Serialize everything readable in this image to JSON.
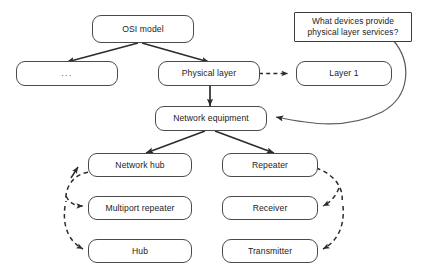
{
  "diagram": {
    "nodes": [
      {
        "id": "osi_model",
        "label": "OSI model"
      },
      {
        "id": "ellipsis",
        "label": "..."
      },
      {
        "id": "physical_layer",
        "label": "Physical layer"
      },
      {
        "id": "layer_1",
        "label": "Layer 1"
      },
      {
        "id": "question",
        "label": "What devices provide physical layer services?"
      },
      {
        "id": "network_equipment",
        "label": "Network equipment"
      },
      {
        "id": "network_hub",
        "label": "Network hub"
      },
      {
        "id": "repeater",
        "label": "Repeater"
      },
      {
        "id": "multiport_repeater",
        "label": "Multiport repeater"
      },
      {
        "id": "receiver",
        "label": "Receiver"
      },
      {
        "id": "hub",
        "label": "Hub"
      },
      {
        "id": "transmitter",
        "label": "Transmitter"
      }
    ],
    "question_lines": [
      "What devices provide",
      "physical layer services?"
    ],
    "edges": [
      {
        "from": "osi_model",
        "to": "ellipsis",
        "style": "solid",
        "label": ""
      },
      {
        "from": "osi_model",
        "to": "physical_layer",
        "style": "solid",
        "label": ""
      },
      {
        "from": "physical_layer",
        "to": "layer_1",
        "style": "dashed",
        "label": ""
      },
      {
        "from": "physical_layer",
        "to": "network_equipment",
        "style": "solid",
        "label": ""
      },
      {
        "from": "question",
        "to": "network_equipment",
        "style": "solid",
        "label": ""
      },
      {
        "from": "network_equipment",
        "to": "network_hub",
        "style": "solid",
        "label": ""
      },
      {
        "from": "network_equipment",
        "to": "repeater",
        "style": "solid",
        "label": ""
      },
      {
        "from": "network_hub",
        "to": "multiport_repeater",
        "style": "dashed",
        "label": ""
      },
      {
        "from": "network_hub",
        "to": "hub",
        "style": "dashed",
        "label": ""
      },
      {
        "from": "repeater",
        "to": "receiver",
        "style": "dashed",
        "label": ""
      },
      {
        "from": "repeater",
        "to": "transmitter",
        "style": "dashed",
        "label": ""
      }
    ],
    "colors": {
      "node_border": "#4a4a4a",
      "node_fill": "#ffffff",
      "text": "#1c1c1c",
      "edge_solid": "#2b2b2b",
      "edge_dashed": "#2b2b2b",
      "background": "#ffffff"
    }
  }
}
